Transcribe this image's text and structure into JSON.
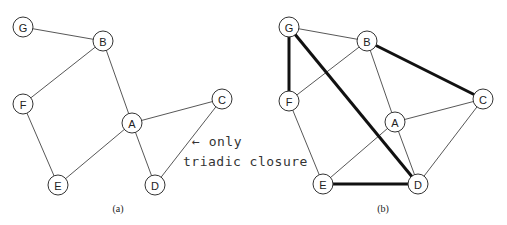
{
  "figure": {
    "panels": [
      {
        "caption": "(a)",
        "nodes": [
          {
            "id": "G",
            "x": 23,
            "y": 27
          },
          {
            "id": "B",
            "x": 103,
            "y": 41
          },
          {
            "id": "F",
            "x": 23,
            "y": 104
          },
          {
            "id": "A",
            "x": 132,
            "y": 123
          },
          {
            "id": "C",
            "x": 222,
            "y": 99
          },
          {
            "id": "E",
            "x": 58,
            "y": 185
          },
          {
            "id": "D",
            "x": 155,
            "y": 185
          }
        ],
        "edges": [
          [
            "G",
            "B"
          ],
          [
            "B",
            "F"
          ],
          [
            "B",
            "A"
          ],
          [
            "F",
            "E"
          ],
          [
            "A",
            "E"
          ],
          [
            "A",
            "C"
          ],
          [
            "A",
            "D"
          ],
          [
            "C",
            "D"
          ]
        ],
        "bold_edges": [],
        "annotation": {
          "line1": "← only",
          "line2": "triadic closure"
        }
      },
      {
        "caption": "(b)",
        "nodes": [
          {
            "id": "G",
            "x": 289,
            "y": 27
          },
          {
            "id": "B",
            "x": 367,
            "y": 41
          },
          {
            "id": "F",
            "x": 289,
            "y": 101
          },
          {
            "id": "A",
            "x": 395,
            "y": 122
          },
          {
            "id": "C",
            "x": 483,
            "y": 99
          },
          {
            "id": "E",
            "x": 323,
            "y": 184
          },
          {
            "id": "D",
            "x": 418,
            "y": 184
          }
        ],
        "edges": [
          [
            "G",
            "B"
          ],
          [
            "B",
            "F"
          ],
          [
            "B",
            "A"
          ],
          [
            "F",
            "E"
          ],
          [
            "A",
            "E"
          ],
          [
            "A",
            "C"
          ],
          [
            "A",
            "D"
          ],
          [
            "C",
            "D"
          ]
        ],
        "bold_edges": [
          [
            "G",
            "F"
          ],
          [
            "G",
            "D"
          ],
          [
            "B",
            "C"
          ],
          [
            "E",
            "D"
          ]
        ]
      }
    ]
  }
}
